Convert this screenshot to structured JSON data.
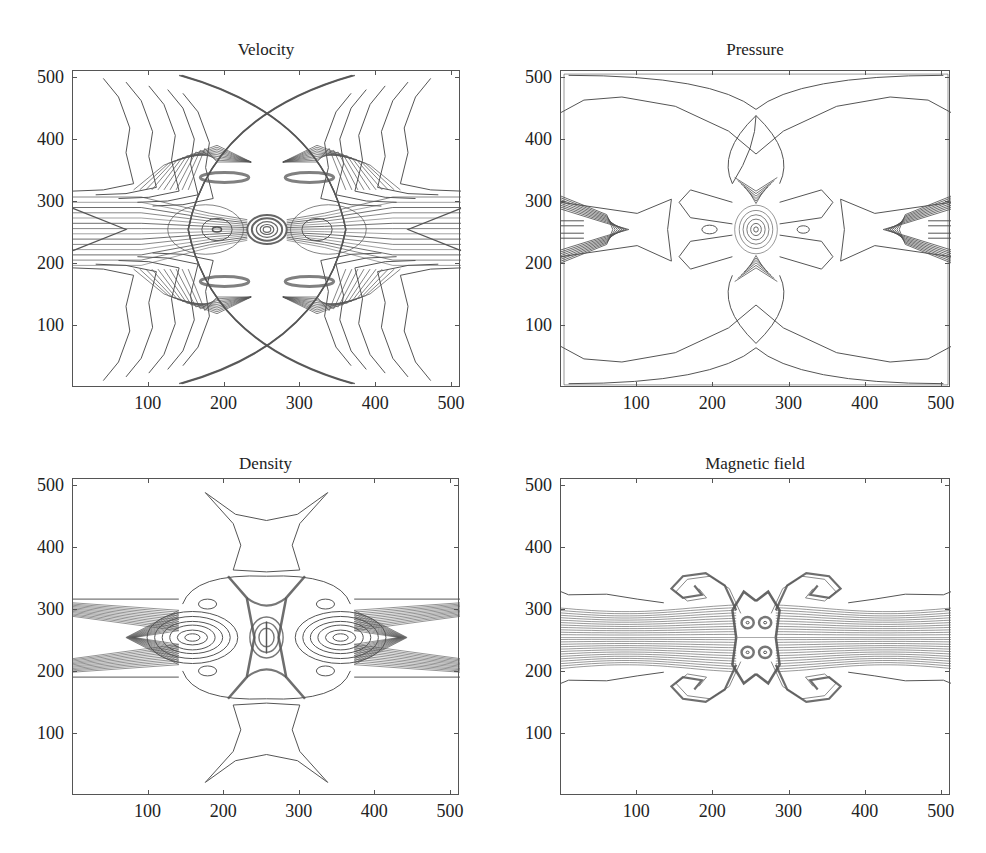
{
  "figure": {
    "layout": "2x2 grid of contour plots",
    "background": "#ffffff",
    "line_color": "#555555"
  },
  "chart_data": [
    {
      "type": "contour",
      "title": "Velocity",
      "xlabel": "",
      "ylabel": "",
      "xlim": [
        0,
        512
      ],
      "ylim": [
        0,
        512
      ],
      "xticks": [
        100,
        200,
        300,
        400,
        500
      ],
      "yticks": [
        100,
        200,
        300,
        400,
        500
      ],
      "xtick_labels": [
        "100",
        "200",
        "300",
        "400",
        "500"
      ],
      "ytick_labels": [
        "100",
        "200",
        "300",
        "400",
        "500"
      ],
      "grid": false,
      "legend": null,
      "description": "Velocity magnitude contours; two crossing arc-shaped shock fronts intersecting near (256,440) and (256,70); dense horizontal jet band between y≈200 and y≈310; small concentric vortex structure at center (256,256); symmetric lobes at (190,256) and (320,256)."
    },
    {
      "type": "contour",
      "title": "Pressure",
      "xlabel": "",
      "ylabel": "",
      "xlim": [
        0,
        512
      ],
      "ylim": [
        0,
        512
      ],
      "xticks": [
        100,
        200,
        300,
        400,
        500
      ],
      "yticks": [
        100,
        200,
        300,
        400,
        500
      ],
      "xtick_labels": [
        "100",
        "200",
        "300",
        "400",
        "500"
      ],
      "ytick_labels": [
        "100",
        "200",
        "300",
        "400",
        "500"
      ],
      "grid": false,
      "legend": null,
      "description": "Pressure contours; large crossing arcs forming an X-shaped envelope meeting at (256,450) and (256,65); four-petal flower structure around center (256,256); bow-shaped dense contours near (80,256) and (430,256); small ellipses at (195,256) and (318,256)."
    },
    {
      "type": "contour",
      "title": "Density",
      "xlabel": "",
      "ylabel": "",
      "xlim": [
        0,
        512
      ],
      "ylim": [
        0,
        512
      ],
      "xticks": [
        100,
        200,
        300,
        400,
        500
      ],
      "yticks": [
        100,
        200,
        300,
        400,
        500
      ],
      "xtick_labels": [
        "100",
        "200",
        "300",
        "400",
        "500"
      ],
      "ytick_labels": [
        "100",
        "200",
        "300",
        "400",
        "500"
      ],
      "grid": false,
      "legend": null,
      "description": "Density contours; X-shaped dense structure centered at (256,256) spanning y≈160–355; star-shaped single contours above (y≈360–490) and below (y≈25–150); horizontal jet band y≈195–315 with nested elliptical contours centered at (155,256) and (360,256)."
    },
    {
      "type": "contour",
      "title": "Magnetic field",
      "xlabel": "",
      "ylabel": "",
      "xlim": [
        0,
        512
      ],
      "ylim": [
        0,
        512
      ],
      "xticks": [
        100,
        200,
        300,
        400,
        500
      ],
      "yticks": [
        100,
        200,
        300,
        400,
        500
      ],
      "xtick_labels": [
        "100",
        "200",
        "300",
        "400",
        "500"
      ],
      "ytick_labels": [
        "100",
        "200",
        "300",
        "400",
        "500"
      ],
      "grid": false,
      "legend": null,
      "description": "Magnetic field contours; dense horizontal band y≈205–305 with a thin split at y≈256; central hourglass structure spanning x≈230–285 with four small vortex cores at (245,280),(268,280),(245,232),(268,232); curled arms rolling up at (160,330),(360,330),(160,185),(360,185); no contours below y≈150 or above y≈360."
    }
  ],
  "panels": [
    {
      "id": "velocity",
      "title": "Velocity",
      "frame": {
        "left": 72,
        "top": 70,
        "width": 388,
        "height": 317
      },
      "title_y": 40
    },
    {
      "id": "pressure",
      "title": "Pressure",
      "frame": {
        "left": 560,
        "top": 70,
        "width": 390,
        "height": 317
      },
      "title_y": 40
    },
    {
      "id": "density",
      "title": "Density",
      "frame": {
        "left": 72,
        "top": 478,
        "width": 387,
        "height": 317
      },
      "title_y": 454
    },
    {
      "id": "magnetic",
      "title": "Magnetic field",
      "frame": {
        "left": 560,
        "top": 478,
        "width": 390,
        "height": 317
      },
      "title_y": 454
    }
  ],
  "axis": {
    "ticks": [
      100,
      200,
      300,
      400,
      500
    ],
    "tick_labels": [
      "100",
      "200",
      "300",
      "400",
      "500"
    ],
    "max": 512
  }
}
